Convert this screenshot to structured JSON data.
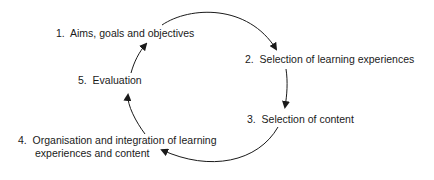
{
  "diagram": {
    "type": "cycle",
    "stages": [
      {
        "number": "1.",
        "label": "Aims, goals and objectives"
      },
      {
        "number": "2.",
        "label": "Selection of learning experiences"
      },
      {
        "number": "3.",
        "label": "Selection of content"
      },
      {
        "number": "4.",
        "label": "Organisation and integration of learning",
        "label_line2": "experiences and content"
      },
      {
        "number": "5.",
        "label": "Evaluation"
      }
    ],
    "flow": [
      "1 → 2",
      "2 → 3",
      "3 → 4",
      "4 → 5",
      "5 → 1"
    ],
    "stroke_color": "#1a1a1a"
  }
}
